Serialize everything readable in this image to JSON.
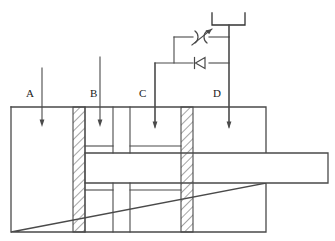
{
  "diagram": {
    "type": "schematic-cross-section",
    "canvas": {
      "width": 335,
      "height": 241
    },
    "colors": {
      "line": "#4a4a4a",
      "line_dark": "#333333",
      "hatch": "#5a5a5a",
      "background": "#ffffff",
      "text": "#1a1a1a"
    },
    "port_labels": [
      {
        "id": "A",
        "text": "A",
        "x": 26,
        "y": 88,
        "arrow_x": 42,
        "arrow_top": 68,
        "arrow_tip": 125
      },
      {
        "id": "B",
        "text": "B",
        "x": 90,
        "y": 88,
        "arrow_x": 100,
        "arrow_top": 57,
        "arrow_tip": 125
      },
      {
        "id": "C",
        "text": "C",
        "x": 139,
        "y": 88,
        "arrow_x": 155,
        "arrow_top": 63,
        "arrow_tip": 127
      },
      {
        "id": "D",
        "text": "D",
        "x": 213,
        "y": 88,
        "arrow_x": 229,
        "arrow_top": 24,
        "arrow_tip": 127
      }
    ],
    "cylinder": {
      "body": {
        "x": 11,
        "y": 107,
        "width": 255,
        "height": 125
      },
      "rod": {
        "x": 85,
        "y": 153,
        "width": 243,
        "height": 30
      },
      "pistons": [
        {
          "name": "left-piston-seal",
          "x": 73,
          "y": 107,
          "width": 12,
          "height": 125
        },
        {
          "name": "right-piston-seal",
          "x": 181,
          "y": 107,
          "width": 12,
          "height": 125
        }
      ],
      "internal_dividers": [
        {
          "name": "divider-1",
          "x": 113,
          "y_top": 107,
          "y_bottom": 153
        },
        {
          "name": "divider-2",
          "x": 130,
          "y_top": 107,
          "y_bottom": 153
        },
        {
          "name": "divider-3",
          "x": 113,
          "y_top": 183,
          "y_bottom": 232
        },
        {
          "name": "divider-4",
          "x": 130,
          "y_top": 183,
          "y_bottom": 232
        }
      ],
      "chamber_shelves": [
        {
          "name": "upper-shelf-left",
          "x1": 85,
          "x2": 113,
          "y": 146
        },
        {
          "name": "upper-shelf-right",
          "x1": 130,
          "x2": 181,
          "y": 146
        },
        {
          "name": "lower-shelf-left",
          "x1": 85,
          "x2": 113,
          "y": 190
        },
        {
          "name": "lower-shelf-right",
          "x1": 130,
          "x2": 181,
          "y": 190
        }
      ]
    },
    "valves": {
      "throttle": {
        "name": "adjustable-throttle-valve",
        "label": "throttle-valve",
        "cx": 201,
        "cy": 37,
        "line_y": 37
      },
      "check": {
        "name": "check-valve",
        "label": "check-valve",
        "cx": 201,
        "cy": 63,
        "line_y": 63,
        "flow_direction": "left"
      }
    },
    "tank": {
      "name": "reservoir-tank",
      "x": 212,
      "y": 13,
      "width": 33,
      "height": 12
    },
    "piping": {
      "branch_left_x": 174,
      "main_right_x": 229,
      "throttle_line_y": 37,
      "check_line_y": 63,
      "tank_stem_top": 25,
      "port_c_riser_x": 155,
      "port_c_riser_y": 63
    }
  }
}
